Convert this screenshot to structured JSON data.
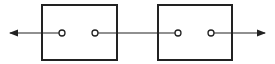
{
  "diagram": {
    "type": "two-port network cascade",
    "stroke_color": "#222222",
    "background": "#ffffff",
    "blocks": [
      {
        "id": "block-1",
        "x": 42,
        "y": 5,
        "width": 75,
        "height": 55,
        "terminals": [
          {
            "x": 62,
            "y": 33
          },
          {
            "x": 95,
            "y": 33
          }
        ]
      },
      {
        "id": "block-2",
        "x": 158,
        "y": 5,
        "width": 74,
        "height": 55,
        "terminals": [
          {
            "x": 178,
            "y": 33
          },
          {
            "x": 211,
            "y": 33
          }
        ]
      }
    ],
    "connections": [
      {
        "from": "terminal-1a",
        "to": "left-arrow",
        "direction": "left"
      },
      {
        "from": "terminal-1b",
        "to": "terminal-2a",
        "direction": "none"
      },
      {
        "from": "terminal-2b",
        "to": "right-arrow",
        "direction": "right"
      }
    ]
  }
}
